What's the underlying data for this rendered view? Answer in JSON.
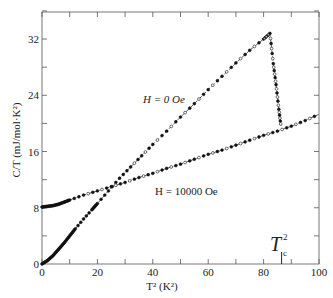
{
  "chart_data": {
    "type": "scatter",
    "title": "",
    "xlabel": "T² (K²)",
    "ylabel": "C/T (mJ/mol·K²)",
    "xlim": [
      0,
      100
    ],
    "ylim": [
      0,
      36
    ],
    "x_ticks": [
      0,
      20,
      40,
      60,
      80,
      100
    ],
    "y_ticks": [
      0,
      8,
      16,
      24,
      32
    ],
    "grid": false,
    "annotations": [
      {
        "text": "H = 0 Oe",
        "x": 40,
        "y": 24
      },
      {
        "text": "H = 10000 Oe",
        "x": 43,
        "y": 8.5
      },
      {
        "text": "Tc²",
        "x": 86.5,
        "y": 3,
        "marker_x": 86.5
      }
    ],
    "series": [
      {
        "name": "H = 0 Oe",
        "x": [
          0,
          2,
          4,
          6,
          8,
          10,
          12,
          15,
          18,
          20,
          24,
          28,
          32,
          36,
          40,
          45,
          50,
          55,
          60,
          65,
          70,
          75,
          80,
          82.3,
          83.5,
          84.5,
          85.5,
          86.3
        ],
        "y": [
          0,
          0.5,
          1.2,
          2.1,
          3.0,
          4.0,
          5.0,
          6.4,
          7.7,
          8.6,
          10.4,
          12.2,
          13.8,
          15.4,
          17.0,
          18.9,
          20.9,
          22.8,
          24.8,
          26.7,
          28.6,
          30.4,
          32.0,
          32.8,
          28.5,
          25.5,
          22.0,
          19.5
        ]
      },
      {
        "name": "H = 10000 Oe",
        "x": [
          0,
          2,
          4,
          6,
          8,
          10,
          15,
          20,
          25,
          30,
          35,
          40,
          45,
          50,
          55,
          60,
          65,
          70,
          75,
          80,
          85,
          90,
          95,
          100
        ],
        "y": [
          8.1,
          8.2,
          8.3,
          8.5,
          8.8,
          9.1,
          9.8,
          10.4,
          11.0,
          11.6,
          12.3,
          12.9,
          13.6,
          14.2,
          14.9,
          15.6,
          16.2,
          16.9,
          17.6,
          18.3,
          18.9,
          19.6,
          20.4,
          21.3
        ]
      }
    ]
  },
  "labels": {
    "ylabel": "C/T (mJ/mol·K²)",
    "xlabel": "T² (K²)",
    "h0": "H = 0 Oe",
    "h10000": "H = 10000 Oe",
    "tc": "T",
    "tc_sub": "c",
    "tc_sup": "2"
  }
}
